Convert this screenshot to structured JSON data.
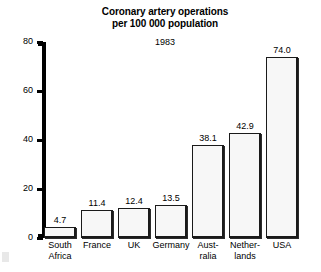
{
  "chart_data": {
    "type": "bar",
    "title": "Coronary artery operations per 100 000 population",
    "title_lines": [
      "Coronary artery operations",
      "per 100 000 population"
    ],
    "subtitle": "1983",
    "xlabel": "",
    "ylabel": "",
    "ylim": [
      0,
      80
    ],
    "yticks": [
      0,
      20,
      40,
      60,
      80
    ],
    "ytick_labels": [
      "0",
      "20",
      "40",
      "60",
      "80"
    ],
    "grid": false,
    "legend": false,
    "categories": [
      "South Africa",
      "France",
      "UK",
      "Germany",
      "Australia",
      "Netherlands",
      "USA"
    ],
    "category_label_lines": [
      [
        "South",
        "Africa"
      ],
      [
        "France"
      ],
      [
        "UK"
      ],
      [
        "Germany"
      ],
      [
        "Aust-",
        "ralia"
      ],
      [
        "Nether-",
        "lands"
      ],
      [
        "USA"
      ]
    ],
    "values": [
      4.7,
      11.4,
      12.4,
      13.5,
      38.1,
      42.9,
      74.0
    ],
    "value_labels": [
      "4.7",
      "11.4",
      "12.4",
      "13.5",
      "38.1",
      "42.9",
      "74.0"
    ],
    "colors": {
      "bar_fill": "#f7f7f7",
      "bar_border": "#1a1a1a",
      "axis": "#000000",
      "text": "#000000",
      "background": "#ffffff"
    }
  }
}
